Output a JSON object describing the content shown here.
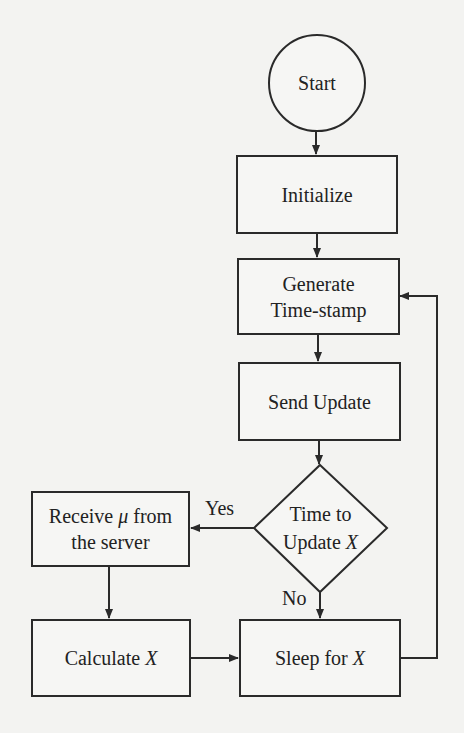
{
  "diagram": {
    "type": "flowchart",
    "nodes": {
      "start": {
        "label": "Start",
        "shape": "circle"
      },
      "initialize": {
        "label": "Initialize",
        "shape": "process"
      },
      "generate": {
        "line1": "Generate",
        "line2": "Time-stamp",
        "shape": "process"
      },
      "send_update": {
        "label": "Send Update",
        "shape": "process"
      },
      "decision": {
        "line1": "Time to",
        "line2_prefix": "Update ",
        "line2_var": "X",
        "shape": "decision"
      },
      "receive": {
        "line1_prefix": "Receive ",
        "line1_var": "μ",
        "line1_suffix": " from",
        "line2": "the server",
        "shape": "process"
      },
      "calculate": {
        "prefix": "Calculate ",
        "var": "X",
        "shape": "process"
      },
      "sleep": {
        "prefix": "Sleep for ",
        "var": "X",
        "shape": "process"
      }
    },
    "edge_labels": {
      "yes": "Yes",
      "no": "No"
    },
    "edges": [
      {
        "from": "start",
        "to": "initialize"
      },
      {
        "from": "initialize",
        "to": "generate"
      },
      {
        "from": "generate",
        "to": "send_update"
      },
      {
        "from": "send_update",
        "to": "decision"
      },
      {
        "from": "decision",
        "to": "receive",
        "label": "Yes"
      },
      {
        "from": "decision",
        "to": "sleep",
        "label": "No"
      },
      {
        "from": "receive",
        "to": "calculate"
      },
      {
        "from": "calculate",
        "to": "sleep"
      },
      {
        "from": "sleep",
        "to": "generate"
      }
    ]
  }
}
